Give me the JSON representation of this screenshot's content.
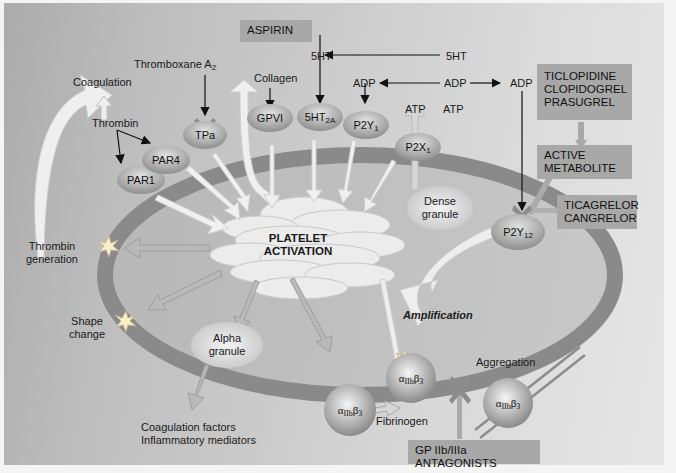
{
  "diagram": {
    "topic": "Platelet activation pathways and antiplatelet drug targets",
    "drug_boxes": {
      "aspirin": "ASPIRIN",
      "thienopyridines": [
        "TICLOPIDINE",
        "CLOPIDOGREL",
        "PRASUGREL"
      ],
      "active_metabolite": [
        "ACTIVE",
        "METABOLITE"
      ],
      "p2y12_direct": [
        "TICAGRELOR",
        "CANGRELOR"
      ],
      "gp_antagonists": "GP IIb/IIIa ANTAGONISTS"
    },
    "agonists": {
      "thromboxane": "Thromboxane A",
      "thromboxane_sub": "2",
      "collagen": "Collagen",
      "thrombin": "Thrombin",
      "fivehtA": "5HT",
      "fivehtB": "5HT",
      "adpA": "ADP",
      "adpB": "ADP",
      "adpC": "ADP",
      "atpA": "ATP",
      "atpB": "ATP"
    },
    "receptors": {
      "par1": "PAR1",
      "par4": "PAR4",
      "tpa": "TPa",
      "gpvi": "GPVI",
      "fiveht2a": "5HT",
      "fiveht2a_sub": "2A",
      "p2y1": "P2Y",
      "p2y1_sub": "1",
      "p2x1": "P2X",
      "p2x1_sub": "1",
      "p2y12": "P2Y",
      "p2y12_sub": "12",
      "integrin_alpha": "α",
      "integrin_sub": "IIb",
      "integrin_beta": "β",
      "integrin_beta_sub": "3"
    },
    "center": {
      "line1": "PLATELET",
      "line2": "ACTIVATION"
    },
    "outcomes": {
      "coagulation": "Coagulation",
      "thrombin_gen": [
        "Thrombin",
        "generation"
      ],
      "shape_change": [
        "Shape",
        "change"
      ],
      "alpha_granule": [
        "Alpha",
        "granule"
      ],
      "dense_granule": [
        "Dense",
        "granule"
      ],
      "alpha_products": [
        "Coagulation factors",
        "Inflammatory mediators"
      ],
      "amplification": "Amplification",
      "aggregation": "Aggregation",
      "fibrinogen": "Fibrinogen"
    },
    "colors": {
      "background": "#c4c4c4",
      "membrane": "#8a8a8a",
      "receptor": "#a9a9a9",
      "drug_box": "#a8a8a8",
      "arrow_fill": "#f2f2f2",
      "block_x": "#8c8c8c"
    }
  }
}
